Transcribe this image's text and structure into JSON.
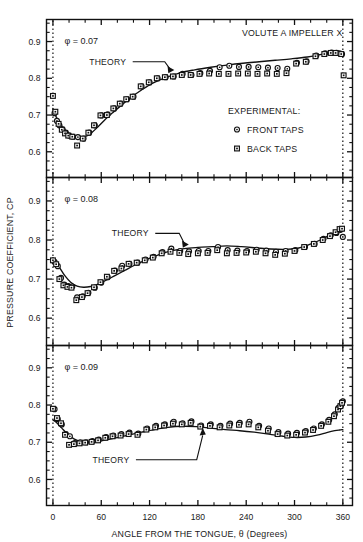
{
  "figure": {
    "title_annotation": "VOLUTE A IMPELLER X",
    "ylabel": "PRESSURE COEFFICIENT, CP",
    "xlabel": "ANGLE FROM THE TONGUE, θ (Degrees)",
    "theory_label": "THEORY",
    "legend": {
      "heading": "EXPERIMENTAL:",
      "entries": [
        {
          "label": "FRONT TAPS",
          "marker": "circle-with-dot"
        },
        {
          "label": "BACK TAPS",
          "marker": "square-with-dot"
        }
      ]
    },
    "colors": {
      "ink": "#111111",
      "paper": "#ffffff"
    }
  },
  "chart_data": {
    "type": "scatter",
    "title": "VOLUTE A IMPELLER X",
    "xlabel": "ANGLE FROM THE TONGUE, θ (Degrees)",
    "ylabel": "PRESSURE COEFFICIENT, CP",
    "xlim": [
      -8,
      372
    ],
    "ylim": [
      0.53,
      0.96
    ],
    "xticks": [
      0,
      60,
      120,
      180,
      240,
      300,
      360
    ],
    "xticklabels": [
      "0",
      "60",
      "120",
      "180",
      "240",
      "300",
      "360"
    ],
    "xtick_minor_step": 20,
    "yticks": [
      0.6,
      0.7,
      0.8,
      0.9
    ],
    "yticklabels": [
      "0.6",
      "0.7",
      "0.8",
      "0.9"
    ],
    "ytick_minor_step": 0.025,
    "grid": false,
    "legend_position": "inside-right-upper-panel",
    "vertical_reference_lines": [
      0,
      360
    ],
    "panels": [
      {
        "id": "phi-007",
        "annotation": "φ = 0.07",
        "phi": 0.07,
        "series": [
          {
            "name": "FRONT TAPS",
            "marker": "circle-with-dot",
            "x": [
              2,
              5,
              8,
              12,
              16,
              20,
              25,
              31,
              38,
              45,
              52,
              60,
              68,
              76,
              84,
              92,
              100,
              110,
              120,
              130,
              140,
              150,
              161,
              172,
              183,
              195,
              207,
              219,
              231,
              243,
              255,
              267,
              279,
              291,
              303,
              315,
              327,
              338,
              346,
              352,
              356,
              359
            ],
            "y": [
              0.705,
              0.684,
              0.672,
              0.661,
              0.652,
              0.644,
              0.641,
              0.64,
              0.636,
              0.652,
              0.672,
              0.699,
              0.702,
              0.718,
              0.731,
              0.743,
              0.75,
              0.778,
              0.789,
              0.8,
              0.803,
              0.805,
              0.812,
              0.809,
              0.814,
              0.82,
              0.83,
              0.834,
              0.831,
              0.831,
              0.83,
              0.829,
              0.828,
              0.826,
              0.842,
              0.846,
              0.862,
              0.868,
              0.87,
              0.869,
              0.868,
              0.866
            ]
          },
          {
            "name": "BACK TAPS",
            "marker": "square-with-dot",
            "x": [
              0,
              3,
              7,
              11,
              15,
              19,
              24,
              30,
              37,
              44,
              51,
              59,
              67,
              75,
              83,
              91,
              99,
              109,
              119,
              129,
              139,
              149,
              160,
              171,
              182,
              194,
              206,
              218,
              230,
              242,
              254,
              266,
              278,
              290,
              302,
              314,
              326,
              337,
              345,
              351,
              358,
              361
            ],
            "y": [
              0.752,
              0.709,
              0.676,
              0.66,
              0.65,
              0.644,
              0.641,
              0.617,
              0.636,
              0.652,
              0.672,
              0.699,
              0.7,
              0.718,
              0.731,
              0.743,
              0.75,
              0.778,
              0.789,
              0.8,
              0.803,
              0.805,
              0.809,
              0.809,
              0.812,
              0.813,
              0.812,
              0.812,
              0.813,
              0.813,
              0.812,
              0.813,
              0.812,
              0.814,
              0.84,
              0.845,
              0.86,
              0.866,
              0.869,
              0.869,
              0.866,
              0.808
            ]
          }
        ],
        "theory_curve": {
          "x": [
            0,
            4,
            9,
            14,
            20,
            26,
            33,
            40,
            48,
            56,
            64,
            74,
            85,
            97,
            110,
            124,
            140,
            158,
            176,
            196,
            216,
            236,
            256,
            276,
            296,
            316,
            334,
            346,
            354,
            360
          ],
          "y": [
            0.718,
            0.695,
            0.676,
            0.662,
            0.65,
            0.642,
            0.638,
            0.641,
            0.652,
            0.668,
            0.686,
            0.706,
            0.727,
            0.748,
            0.768,
            0.787,
            0.802,
            0.815,
            0.823,
            0.83,
            0.836,
            0.841,
            0.845,
            0.849,
            0.853,
            0.858,
            0.865,
            0.869,
            0.871,
            0.872
          ]
        },
        "theory_arrow": {
          "text_x": 68,
          "text_y": 0.845,
          "tip_x": 150,
          "tip_y": 0.818
        }
      },
      {
        "id": "phi-008",
        "annotation": "φ = 0.08",
        "phi": 0.08,
        "series": [
          {
            "name": "FRONT TAPS",
            "marker": "circle-with-dot",
            "x": [
              2,
              6,
              10,
              14,
              19,
              24,
              30,
              37,
              44,
              52,
              60,
              68,
              77,
              86,
              95,
              105,
              115,
              125,
              136,
              147,
              158,
              169,
              181,
              193,
              205,
              217,
              229,
              241,
              253,
              265,
              277,
              289,
              301,
              313,
              325,
              336,
              345,
              352,
              357,
              360
            ],
            "y": [
              0.744,
              0.733,
              0.703,
              0.686,
              0.682,
              0.681,
              0.653,
              0.656,
              0.665,
              0.678,
              0.691,
              0.705,
              0.722,
              0.734,
              0.739,
              0.742,
              0.75,
              0.757,
              0.769,
              0.778,
              0.772,
              0.771,
              0.772,
              0.772,
              0.782,
              0.774,
              0.773,
              0.772,
              0.775,
              0.773,
              0.77,
              0.772,
              0.774,
              0.782,
              0.79,
              0.803,
              0.812,
              0.818,
              0.826,
              0.808
            ]
          },
          {
            "name": "BACK TAPS",
            "marker": "square-with-dot",
            "x": [
              0,
              4,
              8,
              13,
              18,
              23,
              29,
              36,
              43,
              51,
              59,
              67,
              76,
              85,
              94,
              104,
              114,
              124,
              135,
              146,
              157,
              168,
              180,
              192,
              204,
              216,
              228,
              240,
              252,
              264,
              276,
              288,
              300,
              312,
              324,
              335,
              344,
              351,
              356,
              359
            ],
            "y": [
              0.748,
              0.738,
              0.7,
              0.684,
              0.68,
              0.678,
              0.646,
              0.654,
              0.664,
              0.679,
              0.692,
              0.706,
              0.721,
              0.727,
              0.739,
              0.742,
              0.748,
              0.755,
              0.766,
              0.77,
              0.767,
              0.764,
              0.766,
              0.767,
              0.774,
              0.766,
              0.767,
              0.768,
              0.77,
              0.766,
              0.762,
              0.765,
              0.772,
              0.782,
              0.79,
              0.8,
              0.81,
              0.82,
              0.828,
              0.829
            ]
          }
        ],
        "theory_curve": {
          "x": [
            0,
            4,
            9,
            15,
            22,
            30,
            38,
            47,
            56,
            66,
            77,
            89,
            102,
            116,
            131,
            147,
            163,
            180,
            198,
            216,
            234,
            252,
            270,
            288,
            304,
            318,
            332,
            344,
            354,
            360
          ],
          "y": [
            0.755,
            0.745,
            0.727,
            0.708,
            0.692,
            0.682,
            0.679,
            0.681,
            0.687,
            0.697,
            0.709,
            0.722,
            0.736,
            0.75,
            0.762,
            0.772,
            0.778,
            0.781,
            0.783,
            0.785,
            0.783,
            0.78,
            0.777,
            0.776,
            0.779,
            0.788,
            0.8,
            0.813,
            0.823,
            0.828
          ]
        },
        "theory_arrow": {
          "text_x": 96,
          "text_y": 0.817,
          "tip_x": 168,
          "tip_y": 0.784
        }
      },
      {
        "id": "phi-009",
        "annotation": "φ = 0.09",
        "phi": 0.09,
        "series": [
          {
            "name": "FRONT TAPS",
            "marker": "circle-with-dot",
            "x": [
              2,
              6,
              11,
              16,
              21,
              27,
              34,
              41,
              49,
              57,
              66,
              75,
              85,
              95,
              106,
              117,
              128,
              139,
              150,
              161,
              172,
              184,
              196,
              208,
              220,
              232,
              244,
              256,
              268,
              280,
              292,
              303,
              314,
              324,
              334,
              343,
              350,
              355,
              358,
              360
            ],
            "y": [
              0.789,
              0.762,
              0.748,
              0.722,
              0.716,
              0.698,
              0.7,
              0.7,
              0.703,
              0.707,
              0.714,
              0.718,
              0.722,
              0.726,
              0.723,
              0.737,
              0.744,
              0.748,
              0.755,
              0.751,
              0.756,
              0.745,
              0.748,
              0.744,
              0.75,
              0.752,
              0.755,
              0.744,
              0.737,
              0.727,
              0.723,
              0.725,
              0.73,
              0.737,
              0.748,
              0.76,
              0.775,
              0.793,
              0.8,
              0.81
            ]
          },
          {
            "name": "BACK TAPS",
            "marker": "square-with-dot",
            "x": [
              0,
              5,
              10,
              15,
              20,
              26,
              33,
              40,
              48,
              56,
              65,
              74,
              84,
              94,
              105,
              116,
              127,
              138,
              149,
              160,
              171,
              183,
              195,
              207,
              219,
              231,
              243,
              255,
              267,
              279,
              291,
              302,
              313,
              323,
              333,
              342,
              349,
              354,
              357,
              359
            ],
            "y": [
              0.79,
              0.765,
              0.751,
              0.72,
              0.693,
              0.695,
              0.697,
              0.699,
              0.701,
              0.705,
              0.712,
              0.716,
              0.718,
              0.722,
              0.72,
              0.734,
              0.74,
              0.745,
              0.75,
              0.748,
              0.752,
              0.742,
              0.744,
              0.74,
              0.745,
              0.747,
              0.748,
              0.74,
              0.731,
              0.722,
              0.718,
              0.72,
              0.726,
              0.733,
              0.744,
              0.755,
              0.77,
              0.788,
              0.797,
              0.806
            ]
          }
        ],
        "theory_curve": {
          "x": [
            0,
            5,
            11,
            18,
            26,
            35,
            45,
            56,
            68,
            81,
            95,
            110,
            126,
            143,
            160,
            178,
            196,
            214,
            232,
            250,
            268,
            286,
            300,
            314,
            328,
            340,
            350,
            356,
            360
          ],
          "y": [
            0.76,
            0.752,
            0.738,
            0.722,
            0.709,
            0.702,
            0.7,
            0.702,
            0.707,
            0.713,
            0.72,
            0.727,
            0.734,
            0.74,
            0.743,
            0.742,
            0.738,
            0.734,
            0.731,
            0.727,
            0.722,
            0.716,
            0.713,
            0.714,
            0.719,
            0.726,
            0.731,
            0.733,
            0.734
          ]
        },
        "theory_arrow": {
          "text_x": 72,
          "text_y": 0.653,
          "tip_x": 186,
          "tip_y": 0.737
        }
      }
    ]
  }
}
